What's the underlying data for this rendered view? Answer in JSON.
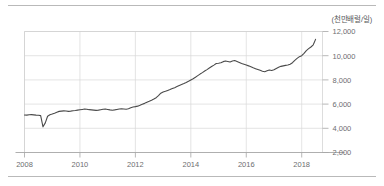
{
  "unit_note": "(천만배럴/일)",
  "chart_data": {
    "type": "line",
    "title": "",
    "subtitle": "",
    "xlabel": "",
    "ylabel": "",
    "unit_annotation": "(천만배럴/일)",
    "grid": true,
    "legend_position": "none",
    "xlim": [
      2008.0,
      2018.75
    ],
    "ylim": [
      2000,
      12000
    ],
    "ytick_labels": [
      "2,000",
      "4,000",
      "6,000",
      "8,000",
      "10,000",
      "12,000"
    ],
    "yticks": [
      2000,
      4000,
      6000,
      8000,
      10000,
      12000
    ],
    "xtick_labels": [
      "2008",
      "2010",
      "2012",
      "2014",
      "2016",
      "2018"
    ],
    "xticks": [
      2008,
      2010,
      2012,
      2014,
      2016,
      2018
    ],
    "series": [
      {
        "name": "production",
        "color": "#4a4a4a",
        "x": [
          2008.0,
          2008.083,
          2008.167,
          2008.25,
          2008.333,
          2008.417,
          2008.5,
          2008.583,
          2008.667,
          2008.75,
          2008.833,
          2008.917,
          2009.0,
          2009.083,
          2009.167,
          2009.25,
          2009.333,
          2009.417,
          2009.5,
          2009.583,
          2009.667,
          2009.75,
          2009.833,
          2009.917,
          2010.0,
          2010.083,
          2010.167,
          2010.25,
          2010.333,
          2010.417,
          2010.5,
          2010.583,
          2010.667,
          2010.75,
          2010.833,
          2010.917,
          2011.0,
          2011.083,
          2011.167,
          2011.25,
          2011.333,
          2011.417,
          2011.5,
          2011.583,
          2011.667,
          2011.75,
          2011.833,
          2011.917,
          2012.0,
          2012.083,
          2012.167,
          2012.25,
          2012.333,
          2012.417,
          2012.5,
          2012.583,
          2012.667,
          2012.75,
          2012.833,
          2012.917,
          2013.0,
          2013.083,
          2013.167,
          2013.25,
          2013.333,
          2013.417,
          2013.5,
          2013.583,
          2013.667,
          2013.75,
          2013.833,
          2013.917,
          2014.0,
          2014.083,
          2014.167,
          2014.25,
          2014.333,
          2014.417,
          2014.5,
          2014.583,
          2014.667,
          2014.75,
          2014.833,
          2014.917,
          2015.0,
          2015.083,
          2015.167,
          2015.25,
          2015.333,
          2015.417,
          2015.5,
          2015.583,
          2015.667,
          2015.75,
          2015.833,
          2015.917,
          2016.0,
          2016.083,
          2016.167,
          2016.25,
          2016.333,
          2016.417,
          2016.5,
          2016.583,
          2016.667,
          2016.75,
          2016.833,
          2016.917,
          2017.0,
          2017.083,
          2017.167,
          2017.25,
          2017.333,
          2017.417,
          2017.5,
          2017.583,
          2017.667,
          2017.75,
          2017.833,
          2017.917,
          2018.0,
          2018.083,
          2018.167,
          2018.25,
          2018.333,
          2018.417,
          2018.5
        ],
        "values": [
          5100,
          5090,
          5120,
          5130,
          5110,
          5090,
          5080,
          5050,
          4120,
          4450,
          5000,
          5120,
          5180,
          5250,
          5330,
          5400,
          5420,
          5440,
          5430,
          5400,
          5420,
          5450,
          5470,
          5500,
          5530,
          5560,
          5590,
          5570,
          5540,
          5520,
          5500,
          5480,
          5500,
          5540,
          5580,
          5600,
          5560,
          5520,
          5490,
          5520,
          5560,
          5600,
          5620,
          5600,
          5580,
          5620,
          5700,
          5760,
          5790,
          5830,
          5900,
          5980,
          6060,
          6150,
          6230,
          6320,
          6420,
          6530,
          6700,
          6900,
          7000,
          7060,
          7130,
          7200,
          7280,
          7360,
          7450,
          7540,
          7620,
          7700,
          7790,
          7890,
          8000,
          8100,
          8220,
          8350,
          8480,
          8600,
          8730,
          8850,
          8980,
          9100,
          9220,
          9350,
          9380,
          9420,
          9510,
          9560,
          9520,
          9480,
          9560,
          9600,
          9520,
          9440,
          9360,
          9300,
          9230,
          9160,
          9080,
          9000,
          8930,
          8860,
          8790,
          8720,
          8680,
          8750,
          8820,
          8780,
          8840,
          8950,
          9050,
          9120,
          9160,
          9200,
          9230,
          9300,
          9420,
          9620,
          9780,
          9920,
          10000,
          10200,
          10420,
          10580,
          10720,
          10900,
          11350
        ]
      }
    ]
  }
}
